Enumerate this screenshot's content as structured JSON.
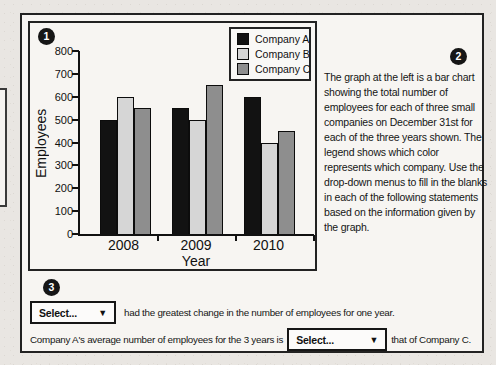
{
  "badges": {
    "chart": "1",
    "description": "2",
    "statements": "3"
  },
  "chart_data": {
    "type": "bar",
    "title": "",
    "categories": [
      "2008",
      "2009",
      "2010"
    ],
    "series": [
      {
        "name": "Company A",
        "color": "#121212",
        "values": [
          500,
          550,
          600
        ]
      },
      {
        "name": "Company B",
        "color": "#d6d6d6",
        "values": [
          600,
          500,
          400
        ]
      },
      {
        "name": "Company C",
        "color": "#8e8e8e",
        "values": [
          550,
          650,
          450
        ]
      }
    ],
    "xlabel": "Year",
    "ylabel": "Employees",
    "ylim": [
      0,
      800
    ],
    "yticks": [
      0,
      100,
      200,
      300,
      400,
      500,
      600,
      700,
      800
    ],
    "grid": false,
    "legend_position": "top-right"
  },
  "description": {
    "text": "The graph at the left is a bar chart showing the total number of employees for each of three small companies on December 31st for each of the three years shown. The legend shows which color represents which company. Use the drop-down menus to fill in the blanks in each of the following statements based on the information given by the graph."
  },
  "statements": {
    "rows": [
      {
        "dropdown": {
          "value": "Select...",
          "arrow": "▼"
        },
        "suffix": "had the greatest change in the number of employees for one year."
      },
      {
        "prefix": "Company A's average number of employees for the 3 years is",
        "dropdown": {
          "value": "Select...",
          "arrow": "▼"
        },
        "suffix": "that of Company C."
      }
    ]
  }
}
